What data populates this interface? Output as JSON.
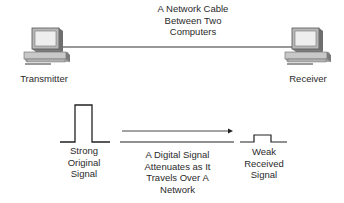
{
  "cable_label": {
    "line1": "A Network Cable",
    "line2": "Between Two",
    "line3": "Computers"
  },
  "transmitter": {
    "label": "Transmitter",
    "icon": "computer-icon"
  },
  "receiver": {
    "label": "Receiver",
    "icon": "computer-icon"
  },
  "strong_signal": {
    "line1": "Strong",
    "line2": "Original",
    "line3": "Signal"
  },
  "attenuation": {
    "line1": "A Digital Signal",
    "line2": "Attenuates as It",
    "line3": "Travels Over A",
    "line4": "Network"
  },
  "weak_signal": {
    "line1": "Weak",
    "line2": "Received",
    "line3": "Signal"
  },
  "colors": {
    "line": "#333333",
    "computer_body": "#c9c9c9",
    "computer_dark": "#8a8a8a",
    "screen": "#efefef"
  }
}
